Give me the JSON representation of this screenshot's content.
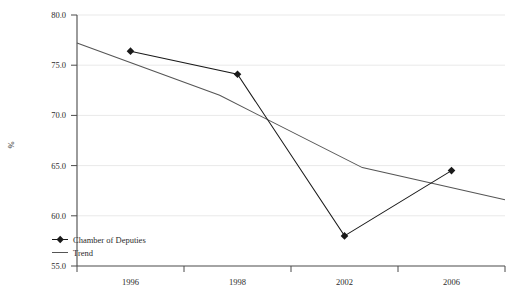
{
  "chart_data": {
    "type": "line",
    "title": "",
    "xlabel": "",
    "ylabel": "%",
    "categories": [
      "1996",
      "1998",
      "2002",
      "2006"
    ],
    "ylim": [
      55.0,
      80.0
    ],
    "ytick_labels": [
      "55.0",
      "60.0",
      "65.0",
      "70.0",
      "75.0",
      "80.0"
    ],
    "ytick_values": [
      55.0,
      60.0,
      65.0,
      70.0,
      75.0,
      80.0
    ],
    "grid": true,
    "legend_position": "bottom-left",
    "series": [
      {
        "name": "Chamber of Deputies",
        "marker": "diamond",
        "color": "#1a1a1a",
        "values": [
          76.4,
          74.1,
          58.0,
          64.5
        ]
      },
      {
        "name": "Trend",
        "marker": "none",
        "color": "#555555",
        "values": [
          77.2,
          72.0,
          64.8,
          61.6
        ]
      }
    ]
  },
  "legend": {
    "items": [
      {
        "label": "Chamber of Deputies",
        "marker": "line-diamond"
      },
      {
        "label": "Trend",
        "marker": "line"
      }
    ]
  },
  "axes": {
    "y_title": "%",
    "y_ticks": [
      "80.0",
      "75.0",
      "70.0",
      "65.0",
      "60.0",
      "55.0"
    ],
    "x_ticks": [
      "1996",
      "1998",
      "2002",
      "2006"
    ]
  },
  "caption": {
    "text": ""
  }
}
